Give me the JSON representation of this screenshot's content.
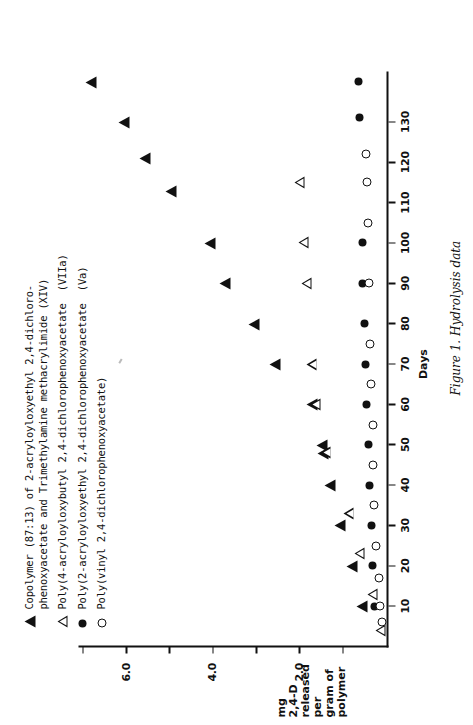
{
  "figure": {
    "caption": "Figure 1.  Hydrolysis data"
  },
  "legend": {
    "items": [
      {
        "symbol": "filled-triangle",
        "label": "Copolymer (87:13) of 2-acryloyloxyethyl 2,4-dichloro-\nphenoxyacetate and Trimethylamine methacrylimide (XIV)"
      },
      {
        "symbol": "open-triangle",
        "label": "Poly(4-acryloyloxybutyl 2,4-dichlorophenoxyacetate  (VIIa)"
      },
      {
        "symbol": "filled-circle",
        "label": "Poly(2-acryloyloxyethyl 2,4-dichlorophenoxyacetate  (Va)"
      },
      {
        "symbol": "open-circle",
        "label": "Poly(vinyl 2,4-dichlorophenoxyacetate)"
      }
    ]
  },
  "chart_data": {
    "type": "scatter",
    "title": "Hydrolysis data",
    "xlabel": "Days",
    "ylabel": "mg\n2,4-D\nreleased\nper\ngram of\npolymer",
    "ylabel_lines": [
      "mg",
      "2,4-D",
      "released",
      "per",
      "gram of",
      "polymer"
    ],
    "xlim": [
      0,
      142
    ],
    "ylim": [
      0,
      7.1
    ],
    "xticks": [
      10,
      20,
      30,
      40,
      50,
      60,
      70,
      80,
      90,
      100,
      110,
      120,
      130
    ],
    "xtick_labels": [
      "10",
      "20",
      "30",
      "40",
      "50",
      "60",
      "70",
      "80",
      "90",
      "100",
      "110",
      "120",
      "130"
    ],
    "yticks": [
      1.0,
      2.0,
      3.0,
      4.0,
      5.0,
      6.0,
      7.0
    ],
    "ytick_labels": [
      "",
      "2.0",
      "",
      "4.0",
      "",
      "6.0",
      ""
    ],
    "grid": false,
    "legend_position": "top-left",
    "series": [
      {
        "name": "Copolymer (87:13) of 2-acryloyloxyethyl 2,4-dichlorophenoxyacetate and Trimethylamine methacrylimide (XIV)",
        "symbol": "filled-triangle",
        "points": [
          [
            10,
            0.55
          ],
          [
            20,
            0.78
          ],
          [
            30,
            1.05
          ],
          [
            40,
            1.28
          ],
          [
            48,
            1.45
          ],
          [
            50,
            1.48
          ],
          [
            60,
            1.7
          ],
          [
            70,
            2.55
          ],
          [
            80,
            3.05
          ],
          [
            90,
            3.7
          ],
          [
            100,
            4.05
          ],
          [
            113,
            4.95
          ],
          [
            121,
            5.55
          ],
          [
            130,
            6.05
          ],
          [
            140,
            6.8
          ]
        ]
      },
      {
        "name": "Poly(4-acryloyloxybutyl 2,4-dichlorophenoxyacetate (VIIa)",
        "symbol": "open-triangle",
        "points": [
          [
            4,
            0.12
          ],
          [
            13,
            0.3
          ],
          [
            23,
            0.6
          ],
          [
            33,
            0.85
          ],
          [
            48,
            1.38
          ],
          [
            60,
            1.62
          ],
          [
            70,
            1.7
          ],
          [
            90,
            1.82
          ],
          [
            100,
            1.9
          ],
          [
            115,
            1.98
          ]
        ]
      },
      {
        "name": "Poly(2-acryloyloxyethyl 2,4-dichlorophenoxyacetate (Va)",
        "symbol": "filled-circle",
        "points": [
          [
            10,
            0.28
          ],
          [
            20,
            0.32
          ],
          [
            30,
            0.35
          ],
          [
            40,
            0.4
          ],
          [
            50,
            0.42
          ],
          [
            60,
            0.45
          ],
          [
            70,
            0.48
          ],
          [
            80,
            0.5
          ],
          [
            90,
            0.55
          ],
          [
            100,
            0.55
          ],
          [
            131,
            0.62
          ],
          [
            140,
            0.65
          ]
        ]
      },
      {
        "name": "Poly(vinyl 2,4-dichlorophenoxyacetate)",
        "symbol": "open-circle",
        "points": [
          [
            6,
            0.1
          ],
          [
            10,
            0.14
          ],
          [
            17,
            0.18
          ],
          [
            25,
            0.25
          ],
          [
            35,
            0.28
          ],
          [
            45,
            0.3
          ],
          [
            55,
            0.32
          ],
          [
            65,
            0.35
          ],
          [
            75,
            0.38
          ],
          [
            90,
            0.4
          ],
          [
            105,
            0.42
          ],
          [
            115,
            0.45
          ],
          [
            122,
            0.48
          ]
        ]
      }
    ]
  }
}
